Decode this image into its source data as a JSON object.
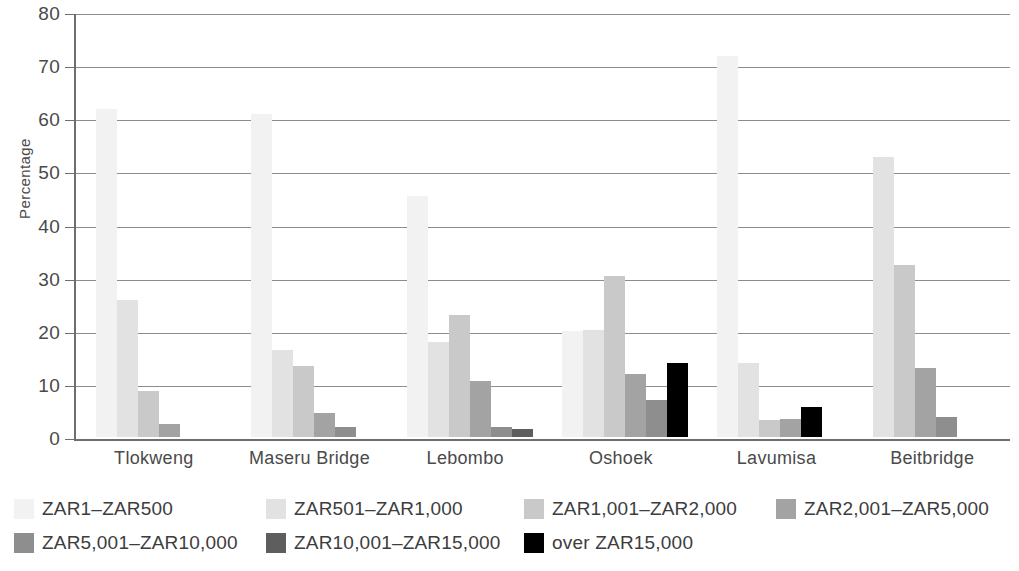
{
  "chart_data": {
    "type": "bar",
    "title": "",
    "xlabel": "",
    "ylabel": "Percentage",
    "ylim": [
      0,
      80
    ],
    "yticks": [
      0,
      10,
      20,
      30,
      40,
      50,
      60,
      70,
      80
    ],
    "grid": true,
    "legend_position": "bottom",
    "categories": [
      "Tlokweng",
      "Maseru Bridge",
      "Lebombo",
      "Oshoek",
      "Lavumisa",
      "Beitbridge"
    ],
    "series": [
      {
        "name": "ZAR1–ZAR500",
        "color": "#f2f2f2",
        "values": [
          62.0,
          61.0,
          45.5,
          20.0,
          72.0,
          0.0
        ]
      },
      {
        "name": "ZAR501–ZAR1,000",
        "color": "#e2e2e2",
        "values": [
          26.0,
          16.5,
          18.0,
          20.2,
          14.0,
          53.0
        ]
      },
      {
        "name": "ZAR1,001–ZAR2,000",
        "color": "#c9c9c9",
        "values": [
          8.7,
          13.5,
          23.0,
          30.5,
          3.3,
          32.5
        ]
      },
      {
        "name": "ZAR2,001–ZAR5,000",
        "color": "#a3a3a3",
        "values": [
          2.5,
          4.5,
          10.5,
          12.0,
          3.5,
          13.0
        ]
      },
      {
        "name": "ZAR5,001–ZAR10,000",
        "color": "#8e8e8e",
        "values": [
          0.0,
          1.8,
          1.8,
          7.0,
          0.0,
          3.7
        ]
      },
      {
        "name": "ZAR10,001–ZAR15,000",
        "color": "#5e5e5e",
        "values": [
          0.0,
          0.0,
          1.5,
          0.0,
          0.0,
          0.0
        ]
      },
      {
        "name": "over ZAR15,000",
        "color": "#000000",
        "values": [
          0.0,
          0.0,
          0.0,
          14.0,
          5.7,
          0.0
        ]
      }
    ]
  },
  "legend": {
    "rows": [
      [
        {
          "label": "ZAR1–ZAR500",
          "color": "#f2f2f2"
        },
        {
          "label": "ZAR501–ZAR1,000",
          "color": "#e2e2e2"
        },
        {
          "label": "ZAR1,001–ZAR2,000",
          "color": "#c9c9c9"
        },
        {
          "label": "ZAR2,001–ZAR5,000",
          "color": "#a3a3a3"
        }
      ],
      [
        {
          "label": "ZAR5,001–ZAR10,000",
          "color": "#8e8e8e"
        },
        {
          "label": "ZAR10,001–ZAR15,000",
          "color": "#5e5e5e"
        },
        {
          "label": "over ZAR15,000",
          "color": "#000000"
        }
      ]
    ]
  },
  "axis": {
    "y_title": "Percentage"
  }
}
